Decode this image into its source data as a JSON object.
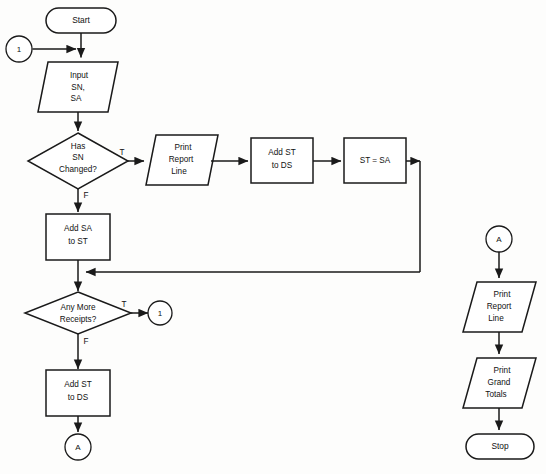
{
  "diagram": {
    "kind": "flowchart",
    "background_color": "#fdfdfc",
    "line_color": "#1a1a1a",
    "fill_color": "#ffffff"
  },
  "nodes": {
    "start": {
      "shape": "terminator",
      "label": "Start"
    },
    "entry_connector": {
      "shape": "connector",
      "label": "1"
    },
    "input_sn_sa": {
      "shape": "parallelogram",
      "line1": "Input",
      "line2": "SN,",
      "line3": "SA"
    },
    "decision_sn_changed": {
      "shape": "diamond",
      "line1": "Has",
      "line2": "SN",
      "line3": "Changed?"
    },
    "print_report_line_top": {
      "shape": "parallelogram",
      "line1": "Print",
      "line2": "Report",
      "line3": "Line"
    },
    "add_st_to_ds_top": {
      "shape": "process",
      "line1": "Add ST",
      "line2": "to DS"
    },
    "st_equals_sa": {
      "shape": "process",
      "line1": "ST = SA"
    },
    "add_sa_to_st": {
      "shape": "process",
      "line1": "Add SA",
      "line2": "to ST"
    },
    "decision_any_more_receipts": {
      "shape": "diamond",
      "line1": "Any More",
      "line2": "Receipts?"
    },
    "loop_connector": {
      "shape": "connector",
      "label": "1"
    },
    "add_st_to_ds_bottom": {
      "shape": "process",
      "line1": "Add ST",
      "line2": "to DS"
    },
    "exit_connector_a": {
      "shape": "connector",
      "label": "A"
    },
    "entry_connector_a": {
      "shape": "connector",
      "label": "A"
    },
    "print_report_line_right": {
      "shape": "parallelogram",
      "line1": "Print",
      "line2": "Report",
      "line3": "Line"
    },
    "print_grand_totals": {
      "shape": "parallelogram",
      "line1": "Print",
      "line2": "Grand",
      "line3": "Totals"
    },
    "stop": {
      "shape": "terminator",
      "label": "Stop"
    }
  },
  "edge_labels": {
    "sn_changed_true": "T",
    "sn_changed_false": "F",
    "any_more_true": "T",
    "any_more_false": "F"
  }
}
